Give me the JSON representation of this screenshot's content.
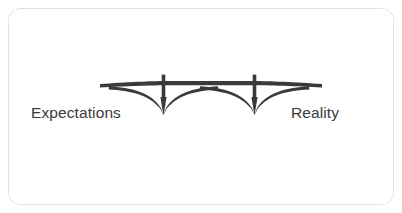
{
  "slide": {
    "background_color": "#ffffff",
    "width": 402,
    "height": 213
  },
  "frame": {
    "style": "dotted",
    "color": "#c9c9c9",
    "corner_radius": 13
  },
  "diagram": {
    "type": "bridge-metaphor",
    "icon_name": "cable-stayed-bridge-icon",
    "icon_color": "#3a3a3a",
    "pylon_count": 2
  },
  "labels": {
    "left": "Expectations",
    "right": "Reality"
  }
}
